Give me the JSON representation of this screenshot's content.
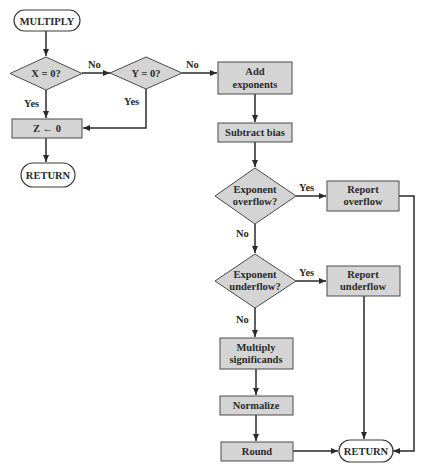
{
  "diagram": {
    "nodes": {
      "start": {
        "label": "MULTIPLY",
        "type": "terminal"
      },
      "x_zero": {
        "label": "X = 0?",
        "type": "decision"
      },
      "y_zero": {
        "label": "Y = 0?",
        "type": "decision"
      },
      "z_zero": {
        "label": "Z ← 0",
        "type": "process"
      },
      "return_left": {
        "label": "RETURN",
        "type": "terminal"
      },
      "add_exp": {
        "line1": "Add",
        "line2": "exponents",
        "type": "process"
      },
      "sub_bias": {
        "label": "Subtract bias",
        "type": "process"
      },
      "overflow": {
        "line1": "Exponent",
        "line2": "overflow?",
        "type": "decision"
      },
      "report_over": {
        "line1": "Report",
        "line2": "overflow",
        "type": "process"
      },
      "underflow": {
        "line1": "Exponent",
        "line2": "underflow?",
        "type": "decision"
      },
      "report_under": {
        "line1": "Report",
        "line2": "underflow",
        "type": "process"
      },
      "mult_sig": {
        "line1": "Multiply",
        "line2": "significands",
        "type": "process"
      },
      "normalize": {
        "label": "Normalize",
        "type": "process"
      },
      "round": {
        "label": "Round",
        "type": "process"
      },
      "return_right": {
        "label": "RETURN",
        "type": "terminal"
      }
    },
    "edge_labels": {
      "x_no": "No",
      "x_yes": "Yes",
      "y_no": "No",
      "y_yes": "Yes",
      "over_yes": "Yes",
      "over_no": "No",
      "under_yes": "Yes",
      "under_no": "No"
    },
    "colors": {
      "shape_fill": "#d4d4d4",
      "terminal_fill": "#ffffff",
      "line": "#2a2a2a"
    }
  }
}
